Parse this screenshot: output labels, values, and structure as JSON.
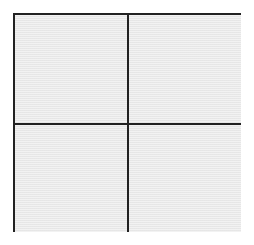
{
  "diagram": {
    "type": "2x2 grid",
    "rows": 2,
    "columns": 2,
    "cells": [
      {
        "row": 1,
        "col": 1,
        "label": ""
      },
      {
        "row": 1,
        "col": 2,
        "label": ""
      },
      {
        "row": 2,
        "col": 1,
        "label": ""
      },
      {
        "row": 2,
        "col": 2,
        "label": ""
      }
    ],
    "colors": {
      "background": "#ffffff",
      "cell_fill": "#ebebeb",
      "line": "#222222"
    }
  }
}
